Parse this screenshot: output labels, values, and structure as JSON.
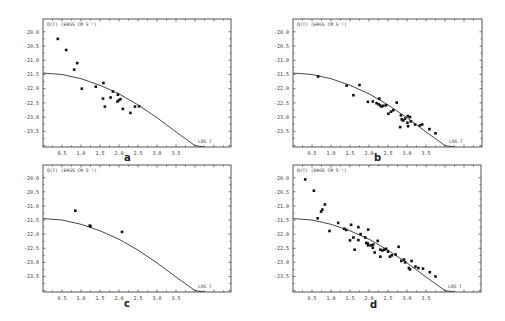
{
  "figure": {
    "background": "#ffffff",
    "ink_color": "#111111"
  },
  "chart_data": [
    {
      "type": "scatter",
      "panel": "a",
      "title": "",
      "ylabel": "Q(T) (ERGS CM S^-1)",
      "ylabel_text": "Q(T)   (ERGS CM S⁻¹)",
      "xlabel": "LOG T",
      "xlabel_text": "LOG T",
      "xlim": [
        0.0,
        4.95
      ],
      "ylim": [
        -24.05,
        -19.55
      ],
      "xticks": [
        "0.5",
        "1.0",
        "1.5",
        "2.0",
        "2.5",
        "3.0",
        "3.5"
      ],
      "yticks": [
        "-20.0",
        "-20.5",
        "-21.0",
        "-21.5",
        "-22.0",
        "-22.5",
        "-23.0",
        "-23.5"
      ],
      "grid": false,
      "legend": null,
      "curve": {
        "x": [
          0.0,
          0.5,
          1.0,
          1.5,
          2.0,
          2.5,
          3.0,
          3.5,
          4.0,
          4.25
        ],
        "y": [
          -21.45,
          -21.5,
          -21.65,
          -21.88,
          -22.18,
          -22.57,
          -23.02,
          -23.52,
          -24.0,
          -24.05
        ]
      },
      "points": {
        "x": [
          0.39,
          0.61,
          0.9,
          0.82,
          1.02,
          1.39,
          1.59,
          1.58,
          1.63,
          1.78,
          1.84,
          1.97,
          1.96,
          2.04,
          2.0,
          2.1,
          2.3,
          2.42,
          2.53
        ],
        "y": [
          -20.25,
          -20.64,
          -21.1,
          -21.33,
          -22.0,
          -21.93,
          -21.8,
          -22.35,
          -22.63,
          -22.31,
          -22.1,
          -22.21,
          -22.45,
          -22.37,
          -22.4,
          -22.71,
          -22.85,
          -22.63,
          -22.62
        ]
      }
    },
    {
      "type": "scatter",
      "panel": "b",
      "ylabel": "Q(T) (ERGS CM S^-1)",
      "ylabel_text": "Q(T)   (ERGS CM S⁻¹)",
      "xlabel": "LOG T",
      "xlabel_text": "LOG T",
      "xlim": [
        0.0,
        4.95
      ],
      "ylim": [
        -24.05,
        -19.55
      ],
      "xticks": [
        "0.5",
        "1.0",
        "1.5",
        "2.0",
        "2.5",
        "3.0",
        "3.5"
      ],
      "yticks": [
        "-20.0",
        "-20.5",
        "-21.0",
        "-21.5",
        "-22.0",
        "-22.5",
        "-23.0",
        "-23.5"
      ],
      "grid": false,
      "legend": null,
      "curve": {
        "x": [
          0.0,
          0.5,
          1.0,
          1.5,
          2.0,
          2.5,
          3.0,
          3.5,
          4.0,
          4.25
        ],
        "y": [
          -21.45,
          -21.5,
          -21.65,
          -21.88,
          -22.18,
          -22.57,
          -23.02,
          -23.52,
          -24.0,
          -24.05
        ]
      },
      "points": {
        "x": [
          0.66,
          1.41,
          1.75,
          1.59,
          1.97,
          2.1,
          2.2,
          2.27,
          2.29,
          2.33,
          2.73,
          2.51,
          2.58,
          2.64,
          2.84,
          2.86,
          2.82,
          3.02,
          3.08,
          3.01,
          3.03,
          3.21,
          3.34,
          3.4,
          3.59,
          3.75,
          2.25,
          2.38,
          2.45,
          2.9,
          2.95,
          3.1
        ],
        "y": [
          -21.57,
          -21.89,
          -21.87,
          -22.23,
          -22.46,
          -22.45,
          -22.51,
          -22.35,
          -22.58,
          -22.63,
          -22.49,
          -22.88,
          -22.81,
          -22.76,
          -22.94,
          -23.08,
          -23.35,
          -22.96,
          -23.0,
          -23.2,
          -23.32,
          -23.26,
          -23.29,
          -23.26,
          -23.42,
          -23.57,
          -22.55,
          -22.6,
          -22.58,
          -23.12,
          -23.05,
          -23.15
        ]
      }
    },
    {
      "type": "scatter",
      "panel": "c",
      "ylabel": "Q(T) (ERGS CM S^-1)",
      "ylabel_text": "Q(T)   (ERGS CM S⁻¹)",
      "xlabel": "LOG T",
      "xlabel_text": "LOG T",
      "xlim": [
        0.0,
        4.95
      ],
      "ylim": [
        -24.05,
        -19.55
      ],
      "xticks": [
        "0.5",
        "1.0",
        "1.5",
        "2.0",
        "2.5",
        "3.0",
        "3.5"
      ],
      "yticks": [
        "-20.0",
        "-20.5",
        "-21.0",
        "-21.5",
        "-22.0",
        "-22.5",
        "-23.0",
        "-23.5"
      ],
      "grid": false,
      "legend": null,
      "curve": {
        "x": [
          0.0,
          0.5,
          1.0,
          1.5,
          2.0,
          2.5,
          3.0,
          3.5,
          4.0,
          4.25
        ],
        "y": [
          -21.45,
          -21.5,
          -21.65,
          -21.88,
          -22.18,
          -22.57,
          -23.02,
          -23.52,
          -24.0,
          -24.05
        ]
      },
      "points": {
        "x": [
          0.85,
          1.23,
          1.25,
          2.08
        ],
        "y": [
          -21.17,
          -21.7,
          -21.72,
          -21.92
        ]
      }
    },
    {
      "type": "scatter",
      "panel": "d",
      "ylabel": "Q(T) (ERGS CM S^-1)",
      "ylabel_text": "Q(T)   (ERGS CM S⁻¹)",
      "xlabel": "LOG T",
      "xlabel_text": "LOG T",
      "xlim": [
        0.0,
        4.95
      ],
      "ylim": [
        -24.05,
        -19.55
      ],
      "xticks": [
        "0.5",
        "1.0",
        "1.5",
        "2.0",
        "2.5",
        "3.0",
        "3.5"
      ],
      "yticks": [
        "-20.0",
        "-20.5",
        "-21.0",
        "-21.5",
        "-22.0",
        "-22.5",
        "-23.0",
        "-23.5"
      ],
      "grid": false,
      "legend": null,
      "curve": {
        "x": [
          0.0,
          0.5,
          1.0,
          1.5,
          2.0,
          2.5,
          3.0,
          3.5,
          4.0,
          4.25
        ],
        "y": [
          -21.45,
          -21.5,
          -21.65,
          -21.88,
          -22.18,
          -22.57,
          -23.02,
          -23.52,
          -24.0,
          -24.05
        ]
      },
      "points": {
        "x": [
          0.32,
          0.55,
          0.84,
          0.77,
          0.74,
          0.65,
          0.96,
          1.19,
          1.35,
          1.53,
          1.72,
          1.98,
          1.5,
          1.59,
          1.72,
          1.78,
          1.9,
          1.93,
          1.97,
          2.11,
          2.23,
          1.4,
          1.62,
          2.05,
          2.15,
          2.3,
          2.35,
          2.4,
          2.45,
          2.55,
          2.6,
          2.7,
          2.78,
          2.85,
          2.92,
          2.95,
          3.05,
          3.08,
          3.12,
          3.22,
          3.3,
          3.42,
          3.6,
          3.75,
          2.3,
          2.1,
          1.98,
          2.5
        ],
        "y": [
          -20.06,
          -20.46,
          -20.95,
          -21.13,
          -21.2,
          -21.44,
          -21.89,
          -21.6,
          -21.81,
          -21.67,
          -21.75,
          -21.84,
          -22.22,
          -22.12,
          -22.21,
          -22.0,
          -22.12,
          -22.31,
          -22.34,
          -22.37,
          -22.24,
          -21.85,
          -22.55,
          -22.4,
          -22.65,
          -22.55,
          -22.58,
          -22.55,
          -22.52,
          -22.8,
          -22.75,
          -22.72,
          -22.45,
          -22.95,
          -22.9,
          -23.0,
          -23.2,
          -23.25,
          -22.95,
          -23.15,
          -23.2,
          -23.22,
          -23.35,
          -23.5,
          -22.8,
          -22.48,
          -22.4,
          -22.62
        ]
      }
    }
  ],
  "panels": {
    "a": {
      "label": "a",
      "ylabel": "Q(T)   (ERGS CM S⁻¹)",
      "xlabel": "LOG T"
    },
    "b": {
      "label": "b",
      "ylabel": "Q(T)   (ERGS CM S⁻¹)",
      "xlabel": "LOG T"
    },
    "c": {
      "label": "c",
      "ylabel": "Q(T)   (ERGS CM S⁻¹)",
      "xlabel": "LOG T"
    },
    "d": {
      "label": "d",
      "ylabel": "Q(T)   (ERGS CM S⁻¹)",
      "xlabel": "LOG T"
    }
  }
}
